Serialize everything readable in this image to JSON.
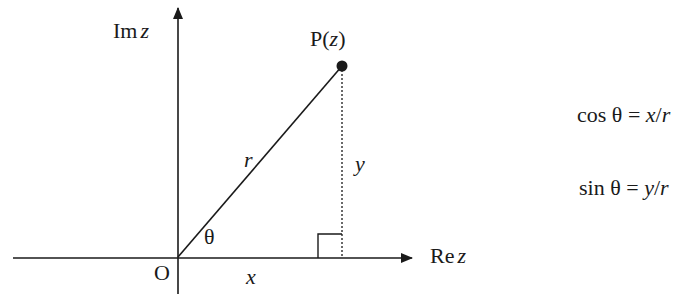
{
  "diagram": {
    "axes": {
      "imaginary_label": {
        "prefix": "Im",
        "var": "z"
      },
      "real_label": {
        "prefix": "Re",
        "var": "z"
      },
      "origin_label": "O"
    },
    "point": {
      "label_prefix": "P(",
      "label_var": "z",
      "label_suffix": ")"
    },
    "segments": {
      "radius_label": "r",
      "vertical_label": "y",
      "horizontal_label": "x",
      "angle_label": "θ"
    },
    "formulas": [
      {
        "func": "cos",
        "theta": "θ",
        "eq": "=",
        "num": "x",
        "slash": "/",
        "den": "r"
      },
      {
        "func": "sin",
        "theta": "θ",
        "eq": "=",
        "num": "y",
        "slash": "/",
        "den": "r"
      }
    ],
    "colors": {
      "ink": "#1a1a1a",
      "background": "#ffffff"
    }
  }
}
